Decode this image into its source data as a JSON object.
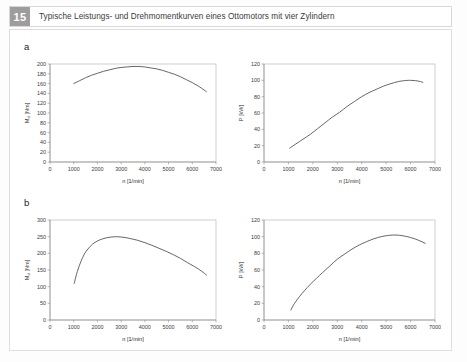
{
  "caption": {
    "number": "15",
    "text": "Typische Leistungs- und Drehmomentkurven eines Ottomotors mit vier Zylindern"
  },
  "panels": [
    {
      "id": "a",
      "label": "a"
    },
    {
      "id": "b",
      "label": "b"
    }
  ],
  "colors": {
    "badge": "#9d9d9d",
    "curve": "#4a4a4a",
    "axis": "#8d8d8d",
    "frame": "#b9b9b9",
    "page": "#ffffff"
  },
  "chart_data": [
    {
      "id": "a-torque",
      "type": "line",
      "panel": "a",
      "title": "",
      "xlabel": "n [1/min]",
      "ylabel": "M_d [Nm]",
      "ylabel_base": "M",
      "ylabel_sub": "d",
      "ylabel_unit": " [Nm]",
      "xlim": [
        0,
        7000
      ],
      "ylim": [
        0,
        200
      ],
      "xticks": [
        0,
        1000,
        2000,
        3000,
        4000,
        5000,
        6000,
        7000
      ],
      "yticks": [
        0,
        20,
        40,
        60,
        80,
        100,
        120,
        140,
        160,
        180,
        200
      ],
      "grid": false,
      "legend": "none",
      "x": [
        1000,
        1250,
        1500,
        1750,
        2000,
        2250,
        2500,
        2750,
        3000,
        3250,
        3500,
        3750,
        4000,
        4250,
        4500,
        4750,
        5000,
        5250,
        5500,
        5750,
        6000,
        6250,
        6500,
        6600
      ],
      "y": [
        160,
        166,
        172,
        177,
        181,
        185,
        188,
        191,
        193,
        194,
        195,
        195,
        194,
        192,
        190,
        187,
        183,
        179,
        174,
        168,
        162,
        155,
        147,
        143
      ]
    },
    {
      "id": "a-power",
      "type": "line",
      "panel": "a",
      "title": "",
      "xlabel": "n [1/min]",
      "ylabel": "P [kW]",
      "ylabel_base": "P",
      "ylabel_sub": "",
      "ylabel_unit": " [kW]",
      "xlim": [
        0,
        7000
      ],
      "ylim": [
        0,
        120
      ],
      "xticks": [
        0,
        1000,
        2000,
        3000,
        4000,
        5000,
        6000,
        7000
      ],
      "yticks": [
        0,
        20,
        40,
        60,
        80,
        100,
        120
      ],
      "grid": false,
      "legend": "none",
      "x": [
        1050,
        1300,
        1600,
        1900,
        2200,
        2500,
        2800,
        3100,
        3400,
        3700,
        4000,
        4300,
        4600,
        4900,
        5200,
        5500,
        5800,
        6000,
        6200,
        6400,
        6500
      ],
      "y": [
        17,
        22,
        28,
        34,
        41,
        48,
        55,
        61,
        68,
        74,
        80,
        85,
        89,
        93,
        96,
        98.5,
        99.8,
        100,
        99.6,
        98.5,
        97.5
      ]
    },
    {
      "id": "b-torque",
      "type": "line",
      "panel": "b",
      "title": "",
      "xlabel": "n [1/min]",
      "ylabel": "M_d [Nm]",
      "ylabel_base": "M",
      "ylabel_sub": "d",
      "ylabel_unit": " [Nm]",
      "xlim": [
        0,
        7000
      ],
      "ylim": [
        0,
        300
      ],
      "xticks": [
        0,
        1000,
        2000,
        3000,
        4000,
        5000,
        6000,
        7000
      ],
      "yticks": [
        0,
        50,
        100,
        150,
        200,
        250,
        300
      ],
      "grid": false,
      "legend": "none",
      "x": [
        1020,
        1150,
        1300,
        1450,
        1600,
        1800,
        2000,
        2200,
        2400,
        2600,
        2800,
        3000,
        3200,
        3400,
        3700,
        4000,
        4300,
        4600,
        4900,
        5200,
        5500,
        5800,
        6100,
        6400,
        6600
      ],
      "y": [
        110,
        145,
        175,
        198,
        213,
        228,
        237,
        243,
        247,
        249,
        250,
        249,
        247,
        244,
        239,
        232,
        224,
        215,
        206,
        196,
        185,
        172,
        160,
        146,
        135
      ]
    },
    {
      "id": "b-power",
      "type": "line",
      "panel": "b",
      "title": "",
      "xlabel": "n [1/min]",
      "ylabel": "P [kW]",
      "ylabel_base": "P",
      "ylabel_sub": "",
      "ylabel_unit": " [kW]",
      "xlim": [
        0,
        7000
      ],
      "ylim": [
        0,
        120
      ],
      "xticks": [
        0,
        1000,
        2000,
        3000,
        4000,
        5000,
        6000,
        7000
      ],
      "yticks": [
        0,
        20,
        40,
        60,
        80,
        100,
        120
      ],
      "grid": false,
      "legend": "none",
      "x": [
        1100,
        1250,
        1450,
        1650,
        1900,
        2150,
        2400,
        2700,
        3000,
        3300,
        3600,
        3900,
        4200,
        4500,
        4800,
        5100,
        5400,
        5700,
        6000,
        6300,
        6600
      ],
      "y": [
        12,
        20,
        28,
        35,
        43,
        50,
        57,
        65,
        73,
        79,
        85,
        90,
        94,
        97.5,
        100,
        101.5,
        102,
        101,
        99,
        96,
        92
      ]
    }
  ]
}
